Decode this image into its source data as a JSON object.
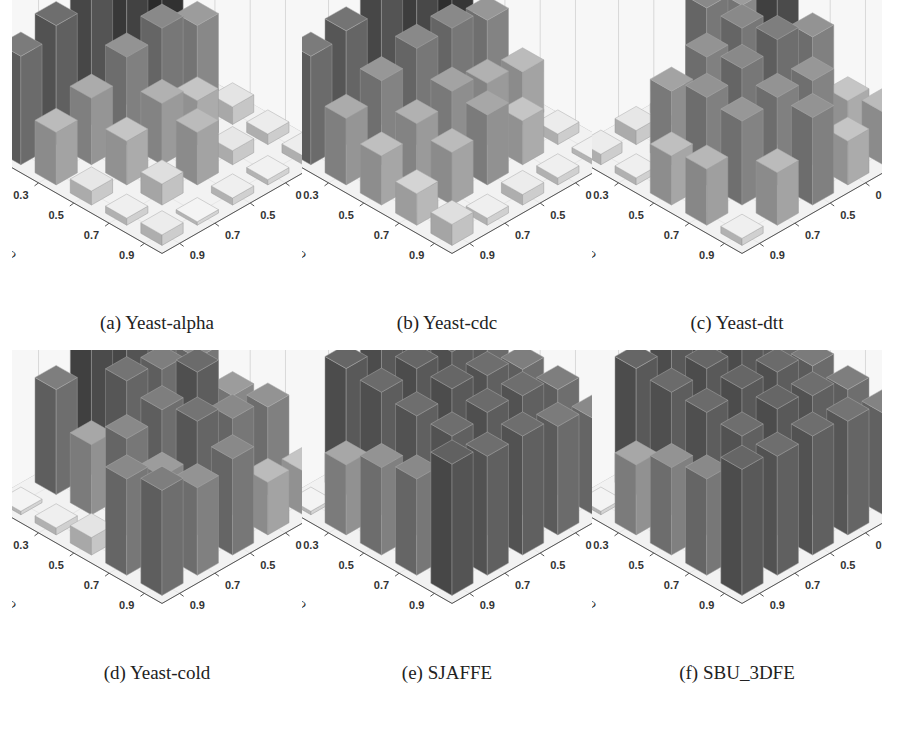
{
  "figure": {
    "panels": [
      {
        "id": "a",
        "caption": "(a) Yeast-alpha"
      },
      {
        "id": "b",
        "caption": "(b) Yeast-cdc"
      },
      {
        "id": "c",
        "caption": "(c) Yeast-dtt"
      },
      {
        "id": "d",
        "caption": "(d) Yeast-cold"
      },
      {
        "id": "e",
        "caption": "(e) SJAFFE"
      },
      {
        "id": "f",
        "caption": "(f) SBU_3DFE"
      }
    ]
  },
  "chart_data": [
    {
      "type": "bar3d",
      "title": "(a) Yeast-alpha",
      "xlabel": "r1",
      "ylabel": "r2",
      "zlabel": "",
      "r1_ticks": [
        "0.1",
        "0.3",
        "0.5",
        "0.7",
        "0.9"
      ],
      "r2_ticks": [
        "0.1",
        "0.3",
        "0.5",
        "0.7",
        "0.9"
      ],
      "note": "values[r2_index][r1_index], relative heights 0-1 (z-axis unlabeled)",
      "values": [
        [
          0.95,
          0.85,
          0.75,
          0.68,
          0.62
        ],
        [
          0.45,
          0.55,
          0.5,
          0.38,
          0.3
        ],
        [
          0.1,
          0.25,
          0.35,
          0.25,
          0.08
        ],
        [
          0.06,
          0.08,
          0.3,
          0.12,
          0.04
        ],
        [
          0.05,
          0.03,
          0.04,
          0.02,
          0.06
        ]
      ],
      "grid": true
    },
    {
      "type": "bar3d",
      "title": "(b) Yeast-cdc",
      "xlabel": "r1",
      "ylabel": "r2",
      "zlabel": "",
      "r1_ticks": [
        "0.1",
        "0.3",
        "0.5",
        "0.7",
        "0.9"
      ],
      "r2_ticks": [
        "0.1",
        "0.3",
        "0.5",
        "0.7",
        "0.9"
      ],
      "values": [
        [
          0.92,
          0.82,
          0.75,
          0.65,
          0.62
        ],
        [
          0.48,
          0.55,
          0.55,
          0.48,
          0.38
        ],
        [
          0.3,
          0.35,
          0.42,
          0.35,
          0.28
        ],
        [
          0.06,
          0.25,
          0.4,
          0.3,
          0.18
        ],
        [
          0.03,
          0.04,
          0.06,
          0.04,
          0.12
        ]
      ],
      "grid": true
    },
    {
      "type": "bar3d",
      "title": "(c) Yeast-dtt",
      "xlabel": "r1",
      "ylabel": "r2",
      "zlabel": "",
      "r1_ticks": [
        "0.1",
        "0.3",
        "0.5",
        "0.7",
        "0.9"
      ],
      "r2_ticks": [
        "0.1",
        "0.3",
        "0.5",
        "0.7",
        "0.9"
      ],
      "values": [
        [
          0.45,
          0.55,
          0.05,
          0.08,
          0.06
        ],
        [
          0.8,
          0.55,
          0.5,
          0.42,
          0.04
        ],
        [
          0.5,
          0.6,
          0.55,
          0.5,
          0.28
        ],
        [
          0.25,
          0.48,
          0.5,
          0.48,
          0.32
        ],
        [
          0.3,
          0.25,
          0.5,
          0.3,
          0.04
        ]
      ],
      "grid": true
    },
    {
      "type": "bar3d",
      "title": "(d) Yeast-cold",
      "xlabel": "r1",
      "ylabel": "r2",
      "zlabel": "",
      "r1_ticks": [
        "0.1",
        "0.3",
        "0.5",
        "0.7",
        "0.9"
      ],
      "r2_ticks": [
        "0.1",
        "0.3",
        "0.5",
        "0.7",
        "0.9"
      ],
      "values": [
        [
          0.6,
          0.75,
          0.8,
          0.6,
          0.02
        ],
        [
          0.55,
          0.6,
          0.65,
          0.4,
          0.04
        ],
        [
          0.45,
          0.7,
          0.6,
          0.55,
          0.1
        ],
        [
          0.5,
          0.55,
          0.65,
          0.45,
          0.55
        ],
        [
          0.25,
          0.3,
          0.55,
          0.5,
          0.6
        ]
      ],
      "grid": true
    },
    {
      "type": "bar3d",
      "title": "(e) SJAFFE",
      "xlabel": "r1",
      "ylabel": "r2",
      "zlabel": "",
      "r1_ticks": [
        "0.1",
        "0.3",
        "0.5",
        "0.7",
        "0.9"
      ],
      "r2_ticks": [
        "0.1",
        "0.3",
        "0.5",
        "0.7",
        "0.9"
      ],
      "values": [
        [
          0.62,
          0.72,
          0.72,
          0.72,
          0.02
        ],
        [
          0.62,
          0.7,
          0.72,
          0.7,
          0.4
        ],
        [
          0.6,
          0.68,
          0.72,
          0.68,
          0.5
        ],
        [
          0.6,
          0.68,
          0.7,
          0.68,
          0.55
        ],
        [
          0.55,
          0.62,
          0.68,
          0.68,
          0.75
        ]
      ],
      "grid": true
    },
    {
      "type": "bar3d",
      "title": "(f) SBU_3DFE",
      "xlabel": "r1",
      "ylabel": "r2",
      "zlabel": "",
      "r1_ticks": [
        "0.1",
        "0.3",
        "0.5",
        "0.7",
        "0.9"
      ],
      "r2_ticks": [
        "0.1",
        "0.3",
        "0.5",
        "0.7",
        "0.9"
      ],
      "values": [
        [
          0.62,
          0.72,
          0.72,
          0.72,
          0.02
        ],
        [
          0.62,
          0.72,
          0.72,
          0.7,
          0.4
        ],
        [
          0.62,
          0.7,
          0.72,
          0.7,
          0.5
        ],
        [
          0.6,
          0.68,
          0.72,
          0.68,
          0.55
        ],
        [
          0.58,
          0.65,
          0.68,
          0.68,
          0.72
        ]
      ],
      "grid": true
    }
  ]
}
